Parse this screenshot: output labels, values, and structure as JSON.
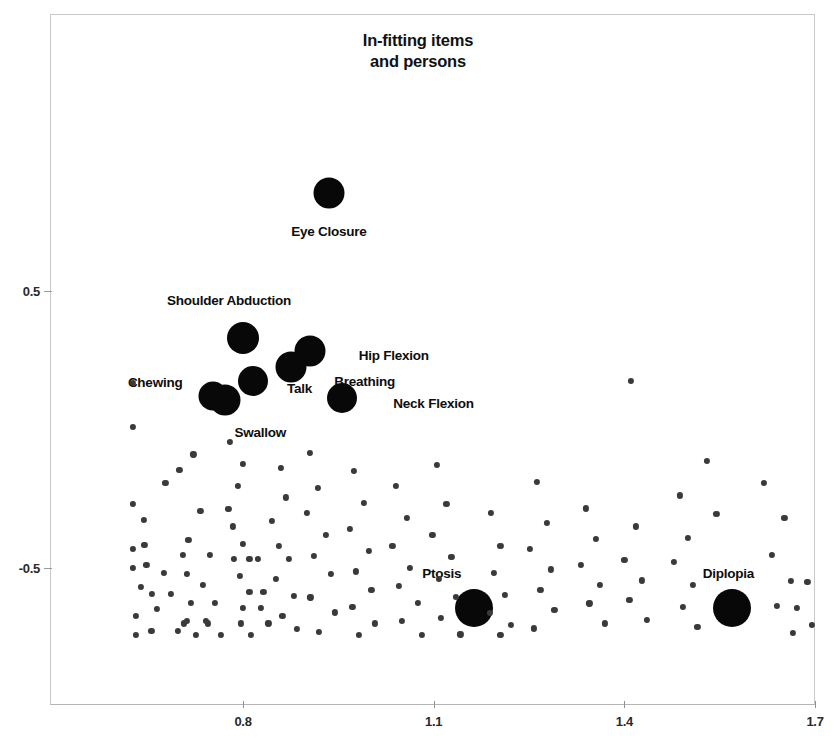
{
  "chart_data": {
    "type": "scatter",
    "title_lines": [
      "In-fitting items",
      "and persons"
    ],
    "xlabel": "",
    "ylabel": "",
    "xlim": [
      0.62,
      1.7
    ],
    "ylim": [
      -0.78,
      1.0
    ],
    "grid": false,
    "legend": "none",
    "xticks": [
      0.8,
      1.1,
      1.4,
      1.7
    ],
    "xtick_labels": [
      "0.8",
      "1.1",
      "1.4",
      "1.7"
    ],
    "yticks": [
      0.5,
      -0.5
    ],
    "ytick_labels": [
      "0.5",
      "-0.5"
    ],
    "series": [
      {
        "name": "items",
        "marker": "large-filled-circle",
        "color": "#080808",
        "points": [
          {
            "label": "Eye Closure",
            "x": 0.935,
            "y": 0.855,
            "r": 15.5,
            "label_dx": 0,
            "label_dy": 38
          },
          {
            "label": "Shoulder Abduction",
            "x": 0.8,
            "y": 0.33,
            "r": 16.0,
            "label_dx": -14,
            "label_dy": -38
          },
          {
            "label": "Hip Flexion",
            "x": 0.905,
            "y": 0.285,
            "r": 15.5,
            "label_dx": 84,
            "label_dy": 4
          },
          {
            "label": "Breathing",
            "x": 0.875,
            "y": 0.225,
            "r": 15.5,
            "label_dx": 74,
            "label_dy": 14
          },
          {
            "label": "Talk",
            "x": 0.815,
            "y": 0.175,
            "r": 15.0,
            "label_dx": 47,
            "label_dy": 7
          },
          {
            "label": "Chewing",
            "x": 0.753,
            "y": 0.12,
            "r": 14.5,
            "label_dx": -58,
            "label_dy": -14
          },
          {
            "label": "Swallow",
            "x": 0.772,
            "y": 0.105,
            "r": 15.5,
            "label_dx": 35,
            "label_dy": 32
          },
          {
            "label": "Neck Flexion",
            "x": 0.955,
            "y": 0.115,
            "r": 15.0,
            "label_dx": 92,
            "label_dy": 5
          },
          {
            "label": "Ptosis",
            "x": 1.163,
            "y": -0.645,
            "r": 19.0,
            "label_dx": -32,
            "label_dy": -35
          },
          {
            "label": "Diplopia",
            "x": 1.57,
            "y": -0.645,
            "r": 19.0,
            "label_dx": -4,
            "label_dy": -35
          }
        ]
      },
      {
        "name": "persons",
        "marker": "small-filled-circle",
        "color": "#3a3a3a",
        "radius": 3.1,
        "points": [
          [
            0.627,
            0.168
          ],
          [
            0.627,
            0.01
          ],
          [
            0.627,
            -0.27
          ],
          [
            0.627,
            -0.43
          ],
          [
            0.644,
            -0.325
          ],
          [
            0.645,
            -0.418
          ],
          [
            0.627,
            -0.5
          ],
          [
            0.648,
            -0.49
          ],
          [
            0.675,
            -0.518
          ],
          [
            0.64,
            -0.568
          ],
          [
            0.657,
            -0.594
          ],
          [
            0.687,
            -0.594
          ],
          [
            0.665,
            -0.648
          ],
          [
            0.632,
            -0.672
          ],
          [
            0.707,
            -0.7
          ],
          [
            0.745,
            -0.7
          ],
          [
            0.656,
            -0.726
          ],
          [
            0.697,
            -0.726
          ],
          [
            0.632,
            -0.742
          ],
          [
            0.722,
            -0.09
          ],
          [
            0.7,
            -0.147
          ],
          [
            0.678,
            -0.194
          ],
          [
            0.733,
            -0.294
          ],
          [
            0.714,
            -0.398
          ],
          [
            0.705,
            -0.452
          ],
          [
            0.748,
            -0.452
          ],
          [
            0.712,
            -0.52
          ],
          [
            0.737,
            -0.56
          ],
          [
            0.718,
            -0.626
          ],
          [
            0.756,
            -0.626
          ],
          [
            0.712,
            -0.69
          ],
          [
            0.741,
            -0.69
          ],
          [
            0.726,
            -0.742
          ],
          [
            0.765,
            -0.742
          ],
          [
            0.78,
            -0.045
          ],
          [
            0.8,
            -0.125
          ],
          [
            0.792,
            -0.205
          ],
          [
            0.777,
            -0.286
          ],
          [
            0.784,
            -0.35
          ],
          [
            0.8,
            -0.412
          ],
          [
            0.786,
            -0.468
          ],
          [
            0.81,
            -0.468
          ],
          [
            0.823,
            -0.468
          ],
          [
            0.795,
            -0.53
          ],
          [
            0.81,
            -0.585
          ],
          [
            0.832,
            -0.585
          ],
          [
            0.8,
            -0.645
          ],
          [
            0.828,
            -0.645
          ],
          [
            0.797,
            -0.7
          ],
          [
            0.84,
            -0.7
          ],
          [
            0.812,
            -0.742
          ],
          [
            0.86,
            -0.14
          ],
          [
            0.868,
            -0.245
          ],
          [
            0.845,
            -0.33
          ],
          [
            0.857,
            -0.42
          ],
          [
            0.872,
            -0.468
          ],
          [
            0.852,
            -0.54
          ],
          [
            0.88,
            -0.6
          ],
          [
            0.862,
            -0.672
          ],
          [
            0.885,
            -0.72
          ],
          [
            0.905,
            -0.085
          ],
          [
            0.918,
            -0.21
          ],
          [
            0.9,
            -0.3
          ],
          [
            0.93,
            -0.38
          ],
          [
            0.912,
            -0.455
          ],
          [
            0.938,
            -0.52
          ],
          [
            0.906,
            -0.606
          ],
          [
            0.944,
            -0.66
          ],
          [
            0.92,
            -0.73
          ],
          [
            0.975,
            -0.15
          ],
          [
            0.99,
            -0.265
          ],
          [
            0.968,
            -0.36
          ],
          [
            0.998,
            -0.438
          ],
          [
            0.978,
            -0.512
          ],
          [
            1.002,
            -0.578
          ],
          [
            0.972,
            -0.64
          ],
          [
            1.008,
            -0.7
          ],
          [
            0.982,
            -0.742
          ],
          [
            1.04,
            -0.205
          ],
          [
            1.058,
            -0.32
          ],
          [
            1.035,
            -0.42
          ],
          [
            1.062,
            -0.5
          ],
          [
            1.045,
            -0.565
          ],
          [
            1.075,
            -0.625
          ],
          [
            1.05,
            -0.69
          ],
          [
            1.082,
            -0.742
          ],
          [
            1.105,
            -0.128
          ],
          [
            1.12,
            -0.27
          ],
          [
            1.098,
            -0.38
          ],
          [
            1.128,
            -0.46
          ],
          [
            1.108,
            -0.54
          ],
          [
            1.135,
            -0.605
          ],
          [
            1.112,
            -0.68
          ],
          [
            1.142,
            -0.74
          ],
          [
            1.19,
            -0.3
          ],
          [
            1.205,
            -0.42
          ],
          [
            1.195,
            -0.518
          ],
          [
            1.212,
            -0.596
          ],
          [
            1.188,
            -0.662
          ],
          [
            1.222,
            -0.705
          ],
          [
            1.205,
            -0.742
          ],
          [
            1.262,
            -0.19
          ],
          [
            1.278,
            -0.338
          ],
          [
            1.252,
            -0.43
          ],
          [
            1.285,
            -0.505
          ],
          [
            1.268,
            -0.58
          ],
          [
            1.29,
            -0.65
          ],
          [
            1.258,
            -0.718
          ],
          [
            1.34,
            -0.285
          ],
          [
            1.355,
            -0.395
          ],
          [
            1.332,
            -0.49
          ],
          [
            1.362,
            -0.56
          ],
          [
            1.345,
            -0.628
          ],
          [
            1.37,
            -0.7
          ],
          [
            1.41,
            0.175
          ],
          [
            1.418,
            -0.35
          ],
          [
            1.4,
            -0.47
          ],
          [
            1.428,
            -0.545
          ],
          [
            1.408,
            -0.615
          ],
          [
            1.435,
            -0.688
          ],
          [
            1.488,
            -0.238
          ],
          [
            1.5,
            -0.392
          ],
          [
            1.478,
            -0.478
          ],
          [
            1.508,
            -0.56
          ],
          [
            1.492,
            -0.64
          ],
          [
            1.515,
            -0.712
          ],
          [
            1.53,
            -0.112
          ],
          [
            1.545,
            -0.305
          ],
          [
            1.62,
            -0.192
          ],
          [
            1.652,
            -0.32
          ],
          [
            1.632,
            -0.452
          ],
          [
            1.662,
            -0.548
          ],
          [
            1.64,
            -0.638
          ],
          [
            1.672,
            -0.645
          ],
          [
            1.688,
            -0.55
          ],
          [
            1.665,
            -0.735
          ],
          [
            1.695,
            -0.705
          ]
        ]
      }
    ]
  }
}
